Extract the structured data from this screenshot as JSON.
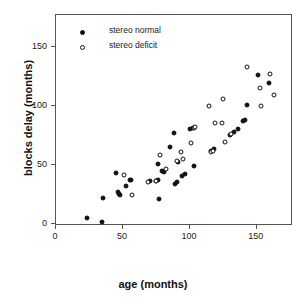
{
  "chart_data": {
    "type": "scatter",
    "title": "",
    "xlabel": "age (months)",
    "ylabel": "blocks delay (months)",
    "xlim": [
      0,
      177
    ],
    "ylim": [
      -2,
      177
    ],
    "xticks": [
      0,
      50,
      100,
      150
    ],
    "yticks": [
      0,
      50,
      100,
      150
    ],
    "xticklabels": [
      "0",
      "50",
      "100",
      "150"
    ],
    "yticklabels": [
      "0",
      "50",
      "100",
      "150"
    ],
    "grid": false,
    "legend_position": "upper-left-inside",
    "series": [
      {
        "name": "stereo normal",
        "marker": "filled-circle",
        "color": "#111111",
        "points": [
          [
            23,
            5
          ],
          [
            34,
            1
          ],
          [
            35,
            22
          ],
          [
            45,
            43
          ],
          [
            46,
            27
          ],
          [
            47,
            25
          ],
          [
            48,
            24
          ],
          [
            52,
            32
          ],
          [
            55,
            37
          ],
          [
            56,
            37
          ],
          [
            70,
            36
          ],
          [
            75,
            36
          ],
          [
            76,
            51
          ],
          [
            76,
            37
          ],
          [
            77,
            21
          ],
          [
            79,
            45
          ],
          [
            81,
            44
          ],
          [
            85,
            65
          ],
          [
            88,
            77
          ],
          [
            89,
            34
          ],
          [
            90,
            35
          ],
          [
            91,
            52
          ],
          [
            94,
            40
          ],
          [
            96,
            42
          ],
          [
            100,
            80
          ],
          [
            102,
            81
          ],
          [
            103,
            49
          ],
          [
            116,
            62
          ],
          [
            118,
            63
          ],
          [
            130,
            75
          ],
          [
            133,
            78
          ],
          [
            136,
            80
          ],
          [
            140,
            87
          ],
          [
            141,
            88
          ],
          [
            143,
            101
          ],
          [
            151,
            126
          ],
          [
            159,
            119
          ]
        ]
      },
      {
        "name": "stereo deficit",
        "marker": "open-circle",
        "color": "#111111",
        "points": [
          [
            51,
            41
          ],
          [
            57,
            24
          ],
          [
            69,
            35
          ],
          [
            75,
            36
          ],
          [
            78,
            58
          ],
          [
            82,
            46
          ],
          [
            90,
            53
          ],
          [
            93,
            61
          ],
          [
            95,
            55
          ],
          [
            101,
            68
          ],
          [
            103,
            81
          ],
          [
            104,
            82
          ],
          [
            114,
            100
          ],
          [
            116,
            61
          ],
          [
            117,
            62
          ],
          [
            119,
            85
          ],
          [
            124,
            85
          ],
          [
            125,
            106
          ],
          [
            126,
            69
          ],
          [
            131,
            76
          ],
          [
            143,
            133
          ],
          [
            152,
            115
          ],
          [
            153,
            100
          ],
          [
            160,
            127
          ],
          [
            163,
            109
          ]
        ]
      }
    ]
  },
  "legend": {
    "items": [
      {
        "label": "stereo normal",
        "marker": "filled"
      },
      {
        "label": "stereo deficit",
        "marker": "open"
      }
    ]
  }
}
